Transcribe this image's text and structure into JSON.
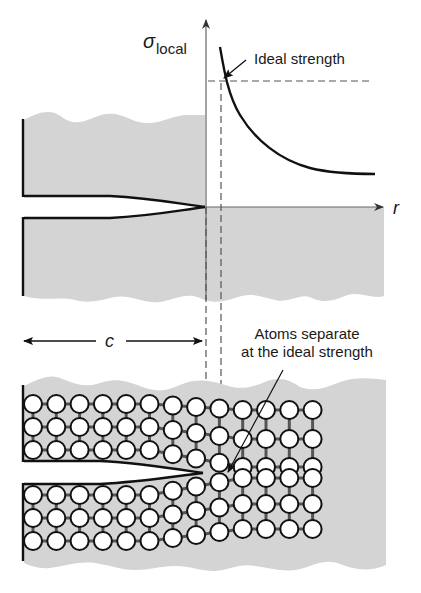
{
  "labels": {
    "sigma": "σ",
    "sigma_sub": "local",
    "ideal_strength": "Ideal strength",
    "r_axis": "r",
    "c_dimension": "c",
    "atoms_line1": "Atoms separate",
    "atoms_line2": "at the ideal strength"
  },
  "lattice": {
    "rows_above_crack": 3,
    "rows_below_crack": 3,
    "columns": 13,
    "crack_tip_column": 8
  },
  "colors": {
    "material": "#d4d4d4",
    "ink": "#111111",
    "atom_fill": "#ffffff",
    "bond": "#555555"
  }
}
